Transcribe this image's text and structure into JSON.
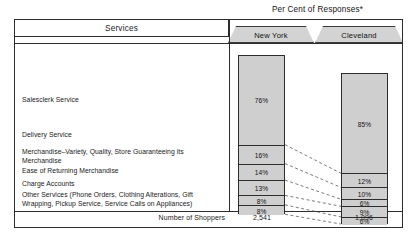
{
  "table": {
    "services_header": "Services",
    "supertitle": "Per Cent of Responses*",
    "footer_label": "Number of Shoppers"
  },
  "columns": [
    {
      "key": "new_york",
      "label": "New York",
      "shoppers": "2,541"
    },
    {
      "key": "cleveland",
      "label": "Cleveland",
      "shoppers": "1,096"
    }
  ],
  "rows": [
    {
      "service": "Salesclerk Service",
      "new_york": "76%",
      "cleveland": "85%"
    },
    {
      "service": "Delivery Service",
      "new_york": "16%",
      "cleveland": "12%"
    },
    {
      "service": "Merchandise–Variety, Quality, Store Guaranteeing its\nMerchandise",
      "new_york": "14%",
      "cleveland": "10%"
    },
    {
      "service": "Ease of Returning Merchandise",
      "new_york": "13%",
      "cleveland": "6%"
    },
    {
      "service": "Charge Accounts",
      "new_york": "8%",
      "cleveland": "9%"
    },
    {
      "service": "Other Services (Phone Orders, Clothing Alterations, Gift\nWrapping, Pickup Service, Service Calls on Appliances)",
      "new_york": "8%",
      "cleveland": "6%"
    }
  ],
  "chart_data": {
    "type": "bar",
    "title": "Per Cent of Responses*",
    "xlabel": "",
    "ylabel": "Per Cent of Responses",
    "categories": [
      "Salesclerk Service",
      "Delivery Service",
      "Merchandise–Variety, Quality, Store Guaranteeing its Merchandise",
      "Ease of Returning Merchandise",
      "Charge Accounts",
      "Other Services (Phone Orders, Clothing Alterations, Gift Wrapping, Pickup Service, Service Calls on Appliances)"
    ],
    "series": [
      {
        "name": "New York",
        "values": [
          76,
          16,
          14,
          13,
          8,
          8
        ],
        "n": 2541
      },
      {
        "name": "Cleveland",
        "values": [
          85,
          12,
          10,
          6,
          9,
          6
        ],
        "n": 1096
      }
    ],
    "stacked": true,
    "ylim": [
      0,
      135
    ],
    "grid": false,
    "legend": "header-tabs",
    "footnote_marker": "*",
    "colors": {
      "segment_fill": "#cfcfcf",
      "stroke": "#2d2d2d",
      "tab_fill": "#d3d3d3"
    }
  },
  "labels": {
    "label_tops": [
      96,
      131,
      148,
      167,
      180,
      191
    ],
    "bar_geometry": {
      "ny_top": 55,
      "ny_left": 238,
      "cl_top": 73,
      "cl_left": 341,
      "width": 47,
      "px_per_pct": 1.18
    }
  }
}
